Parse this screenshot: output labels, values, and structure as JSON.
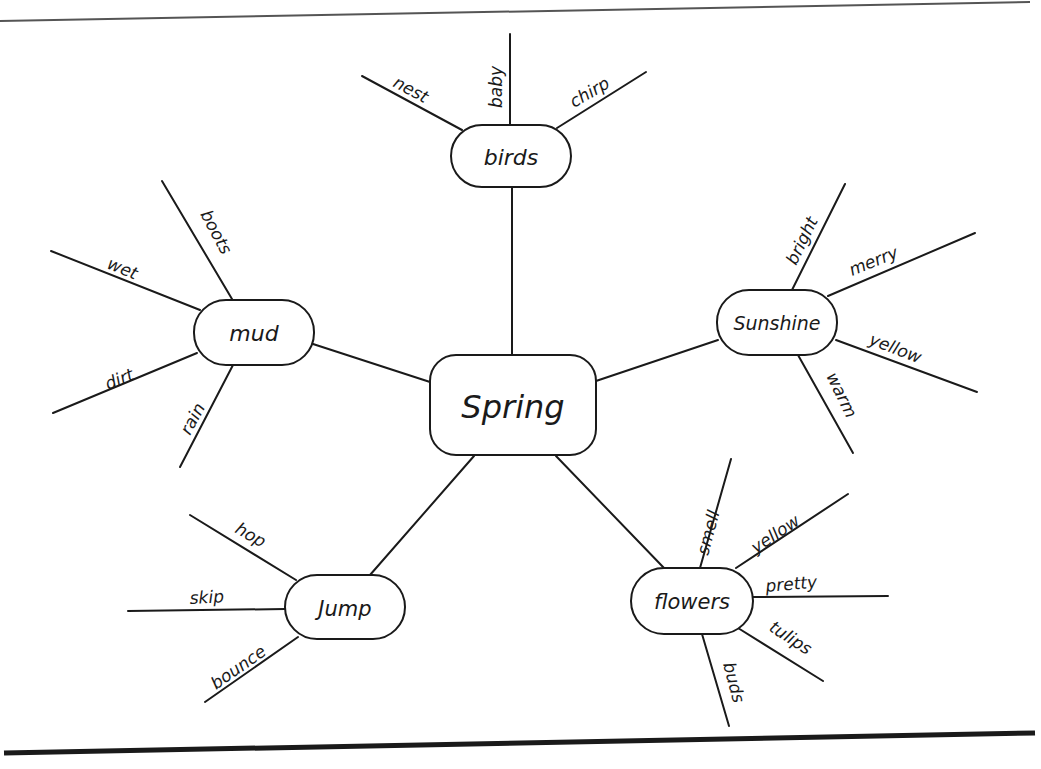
{
  "diagram": {
    "type": "word web / mind map",
    "center": {
      "label": "Spring"
    },
    "nodes": [
      {
        "label": "birds",
        "leaves": [
          "nest",
          "baby",
          "chirp"
        ]
      },
      {
        "label": "mud",
        "leaves": [
          "boots",
          "wet",
          "dirt",
          "rain"
        ]
      },
      {
        "label": "Sunshine",
        "leaves": [
          "bright",
          "merry",
          "yellow",
          "warm"
        ]
      },
      {
        "label": "Jump",
        "leaves": [
          "hop",
          "skip",
          "bounce"
        ]
      },
      {
        "label": "flowers",
        "leaves": [
          "smell",
          "yellow",
          "pretty",
          "tulips",
          "buds"
        ]
      }
    ]
  },
  "colors": {
    "ink": "#1a1a1a",
    "paper": "#ffffff"
  }
}
